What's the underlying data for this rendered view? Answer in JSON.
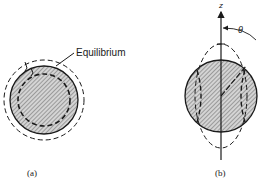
{
  "figure_a": {
    "label_equilibrium": "Equilibrium",
    "caption": "(a)"
  },
  "figure_b": {
    "axis_label": "z",
    "angle_label": "θ",
    "caption": "(b)"
  },
  "colors": {
    "ink": "#1a1a1a",
    "hatch_fill": "#d8d8d8",
    "background": "#ffffff"
  }
}
